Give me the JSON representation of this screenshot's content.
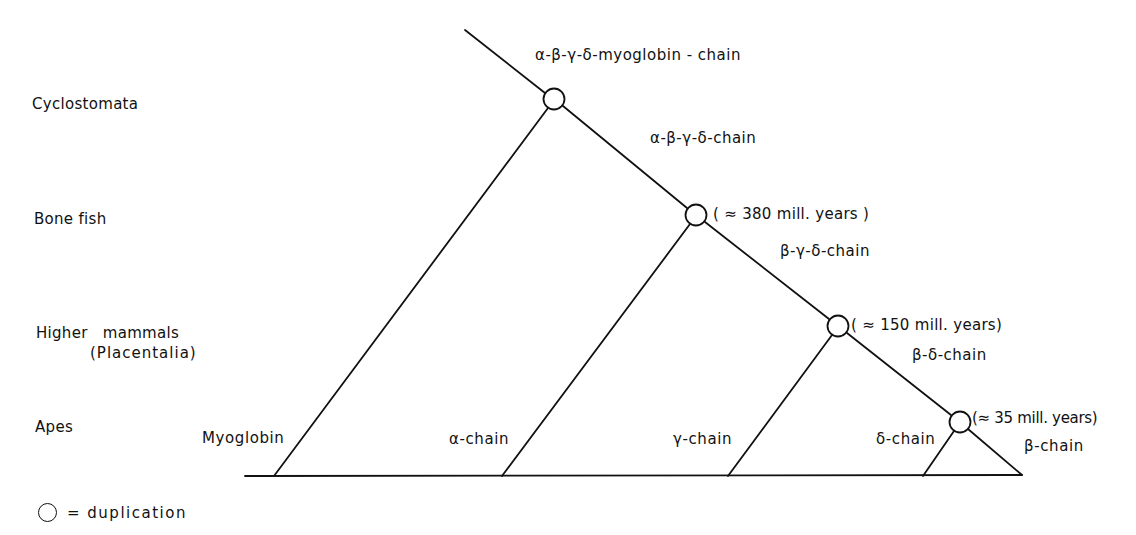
{
  "diagram": {
    "taxa": [
      {
        "label": "Cyclostomata"
      },
      {
        "label": "Bone fish"
      },
      {
        "label": "Higher mammals",
        "sublabel": "(Placentalia)"
      },
      {
        "label": "Apes"
      }
    ],
    "ancestral_chains": [
      {
        "label": "α-β-γ-δ-myoglobin - chain"
      },
      {
        "label": "α-β-γ-δ-chain"
      },
      {
        "label": "β-γ-δ-chain"
      },
      {
        "label": "β-δ-chain"
      }
    ],
    "duplications": [
      {
        "node": 1,
        "age": ""
      },
      {
        "node": 2,
        "age": "( ≈ 380 mill. years )"
      },
      {
        "node": 3,
        "age": "( ≈ 150 mill. years)"
      },
      {
        "node": 4,
        "age": "(≈ 35 mill. years)"
      }
    ],
    "leaves": [
      {
        "label": "Myoglobin"
      },
      {
        "label": "α-chain"
      },
      {
        "label": "γ-chain"
      },
      {
        "label": "δ-chain"
      },
      {
        "label": "β-chain"
      }
    ],
    "legend": {
      "symbol": "circle",
      "text": "= duplication"
    },
    "colors": {
      "line": "#111111",
      "background": "#ffffff"
    }
  }
}
